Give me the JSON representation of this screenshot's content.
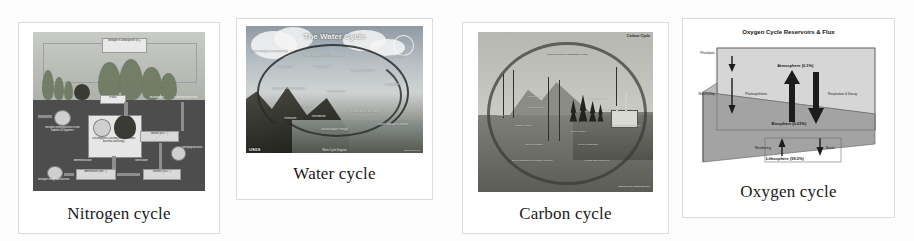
{
  "figure": {
    "background_color": "#fdfdfd",
    "panel_border_color": "#dcdcdc",
    "caption_color": "#1a1a1a",
    "panel_count": 4
  },
  "panels": [
    {
      "id": "nitrogen",
      "caption": "Nitrogen cycle",
      "diagram": {
        "title": "Nitrogen in atmosphere (N₂)",
        "sky_color": "#c9cbc6",
        "soil_color": "#4d4d4d",
        "labels": [
          "Nitrogen in atmosphere (N₂)",
          "Plants",
          "Assimilation",
          "Denitrifying bacteria",
          "Nitrogen-fixing bacteria in root nodules of legumes",
          "Decomposers (aerobic and anaerobic bacteria and fungi)",
          "Ammonification",
          "Nitrification",
          "Nitrifying bacteria",
          "Nitrogen-fixing soil bacteria",
          "Ammonium (NH₄⁺)",
          "Nitrites (NO₂⁻)",
          "Nitrates (NO₃⁻)"
        ]
      }
    },
    {
      "id": "water",
      "caption": "Water cycle",
      "diagram": {
        "title": "The Water Cycle",
        "source_badge": "USGS",
        "credit": "Natural Science",
        "footer": "Water Cycle Diagram",
        "labels": [
          "Water storage in ice and snow",
          "Water storage in the atmosphere",
          "Condensation",
          "Sublimation",
          "Precipitation",
          "Evapotranspiration",
          "Evaporation",
          "Snowmelt runoff to stream",
          "Surface runoff",
          "Spring",
          "Streamflow",
          "Infiltration",
          "Ground-water discharge",
          "Ground-water storage",
          "Water storage in oceans"
        ]
      }
    },
    {
      "id": "carbon",
      "caption": "Carbon cycle",
      "diagram": {
        "title": "Carbon Cycle",
        "credit": "Carbon Cycle\nNatural Science",
        "labels": [
          "Carbon dioxide in atmosphere (CO₂)",
          "Photosynthesis",
          "Plant respiration",
          "Animal respiration",
          "Auto and factory emissions",
          "Organic carbon",
          "Dissolved carbon dioxide",
          "Ocean uptake",
          "Decay organisms",
          "Root respiration",
          "Dead organisms and waste products",
          "Fossils and fossil fuels",
          "Mining"
        ]
      }
    },
    {
      "id": "oxygen",
      "caption": "Oxygen cycle",
      "diagram": {
        "title": "Oxygen Cycle Reservoirs & Flux",
        "reservoirs": [
          {
            "name": "Atmosphere",
            "value": "0.1%",
            "label": "Atmosphere (0.1%)"
          },
          {
            "name": "Biosphere",
            "value": "0.01%",
            "label": "Biosphere (0.01%)"
          },
          {
            "name": "Lithosphere",
            "value": "99.5%",
            "label": "Lithosphere (99.5%)"
          }
        ],
        "flux_labels": [
          "Photolysis",
          "Weathering",
          "Photosynthesis",
          "Respiration & Decay",
          "Weathering",
          "Burial"
        ]
      }
    }
  ]
}
